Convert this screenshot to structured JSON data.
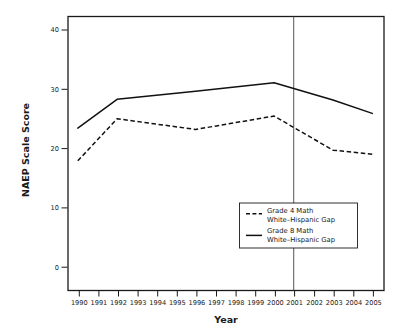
{
  "chart_data": {
    "type": "line",
    "title": "",
    "subtitle": "",
    "xlabel": "Year",
    "ylabel": "NAEP Scale Score",
    "x": [
      1990,
      1992,
      1996,
      2000,
      2003,
      2005
    ],
    "categories": [
      "1990",
      "1991",
      "1992",
      "1993",
      "1994",
      "1995",
      "1996",
      "1997",
      "1998",
      "1999",
      "2000",
      "2001",
      "2002",
      "2003",
      "2004",
      "2005"
    ],
    "xtick_labels": [
      "1990",
      "1991",
      "1992",
      "1993",
      "1994",
      "1995",
      "1996",
      "1997",
      "1998",
      "1999",
      "2000",
      "2001",
      "2002",
      "2003",
      "2004",
      "2005"
    ],
    "ytick_labels": [
      "0",
      "10",
      "20",
      "30",
      "40"
    ],
    "ytick_values": [
      0,
      10,
      20,
      30,
      40
    ],
    "xlim": [
      1989.5,
      2005.6
    ],
    "ylim": [
      0,
      41
    ],
    "grid": false,
    "legend_position": "lower-right-inside",
    "annotations": [
      {
        "type": "vertical-line",
        "x": 2001,
        "label": "2001"
      }
    ],
    "series": [
      {
        "name": "Grade 4 Math White–Hispanic Gap",
        "style": "dashed",
        "color": "#111111",
        "x": [
          1990,
          1992,
          1996,
          2000,
          2003,
          2005
        ],
        "values": [
          19.4,
          25.7,
          24.1,
          26.1,
          21.0,
          20.4
        ]
      },
      {
        "name": "Grade 8 Math White–Hispanic Gap",
        "style": "solid",
        "color": "#111111",
        "x": [
          1990,
          1992,
          1996,
          2000,
          2003,
          2005
        ],
        "values": [
          24.3,
          28.6,
          29.8,
          31.1,
          28.5,
          26.5
        ]
      }
    ]
  },
  "legend": {
    "entries": [
      {
        "line1": "Grade 4 Math",
        "line2": "White–Hispanic Gap",
        "style": "dashed"
      },
      {
        "line1": "Grade 8 Math",
        "line2": "White–Hispanic Gap",
        "style": "solid"
      }
    ]
  },
  "colors": {
    "series": "#111111",
    "frame": "#1a1a1a",
    "reference_line": "#444444",
    "background": "#ffffff"
  }
}
